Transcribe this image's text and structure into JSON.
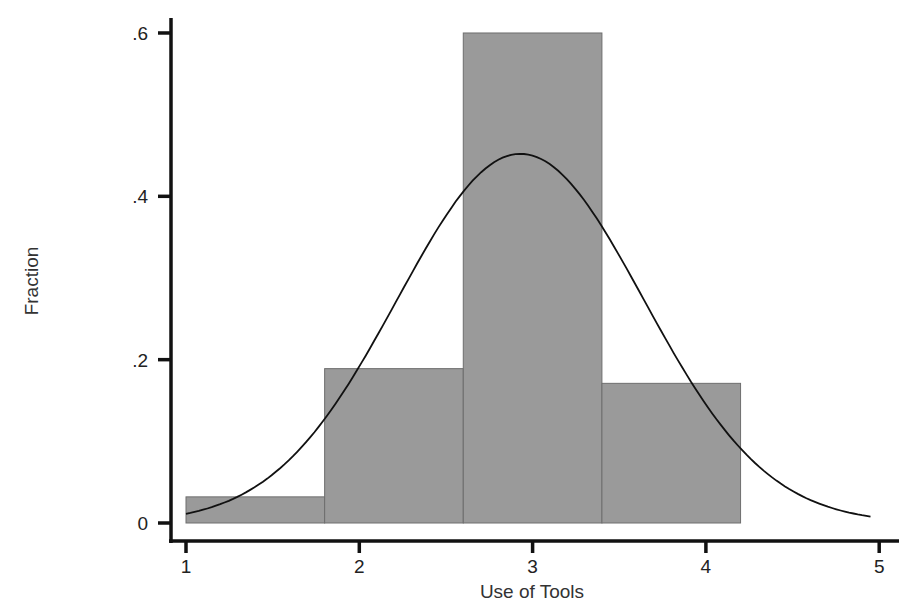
{
  "chart_data": {
    "type": "bar",
    "subtype": "histogram_with_normal_density",
    "title": "",
    "xlabel": "Use of Tools",
    "ylabel": "Fraction",
    "xlim": [
      1,
      5
    ],
    "ylim": [
      0,
      0.6
    ],
    "x_ticks": [
      1,
      2,
      3,
      4,
      5
    ],
    "x_tick_labels": [
      "1",
      "2",
      "3",
      "4",
      "5"
    ],
    "y_ticks": [
      0,
      0.2,
      0.4,
      0.6
    ],
    "y_tick_labels": [
      "0",
      ".2",
      ".4",
      ".6"
    ],
    "grid": false,
    "legend": null,
    "bins": [
      {
        "start": 1.0,
        "end": 1.8,
        "value": 0.032
      },
      {
        "start": 1.8,
        "end": 2.6,
        "value": 0.189
      },
      {
        "start": 2.6,
        "end": 3.4,
        "value": 0.6
      },
      {
        "start": 3.4,
        "end": 4.2,
        "value": 0.171
      }
    ],
    "categories": [
      "1.0-1.8",
      "1.8-2.6",
      "2.6-3.4",
      "3.4-4.2"
    ],
    "values": [
      0.032,
      0.189,
      0.6,
      0.171
    ],
    "overlay": {
      "type": "line",
      "name": "normal density",
      "mean": 2.93,
      "sd": 0.71,
      "peak": 0.452,
      "x_range": [
        1,
        4.95
      ]
    },
    "colors": {
      "bar_fill": "#9a9a9a",
      "bar_stroke": "#6e6e6e",
      "curve": "#111111",
      "axis": "#111111"
    }
  }
}
